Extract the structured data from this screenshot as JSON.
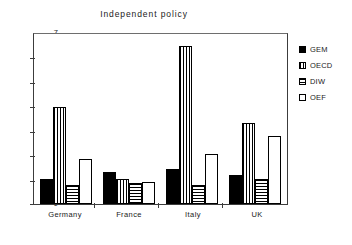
{
  "chart_data": {
    "type": "bar",
    "title": "Independent policy",
    "xlabel": "",
    "ylabel": "",
    "ylim": [
      0,
      7
    ],
    "yticks": [
      0,
      1,
      2,
      3,
      4,
      5,
      6,
      7
    ],
    "ytick_labels": [
      "0",
      "1",
      "2",
      "3",
      "4",
      "5",
      "6",
      "7"
    ],
    "grid": false,
    "legend_position": "right",
    "categories": [
      "Germany",
      "France",
      "Italy",
      "UK"
    ],
    "series": [
      {
        "name": "GEM",
        "fill": "solid",
        "values": [
          1.05,
          1.3,
          1.45,
          1.2
        ]
      },
      {
        "name": "OECD",
        "fill": "vertical-lines",
        "values": [
          4.0,
          1.05,
          6.5,
          3.35
        ]
      },
      {
        "name": "DIW",
        "fill": "horizontal-lines",
        "values": [
          0.8,
          0.85,
          0.8,
          1.05
        ]
      },
      {
        "name": "OEF",
        "fill": "empty",
        "values": [
          1.85,
          0.9,
          2.05,
          2.8
        ]
      }
    ]
  },
  "legend": {
    "entries": [
      {
        "label": "GEM"
      },
      {
        "label": "OECD"
      },
      {
        "label": "DIW"
      },
      {
        "label": "OEF"
      }
    ]
  },
  "colors": {
    "bar_outline": "#000000",
    "axis": "#3c3c3c",
    "text": "#1a1a1a",
    "background": "#ffffff"
  }
}
